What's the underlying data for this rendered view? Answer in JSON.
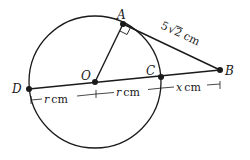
{
  "diagram": {
    "points": {
      "A": {
        "label": "A",
        "x": 123,
        "y": 24
      },
      "B": {
        "label": "B",
        "x": 220,
        "y": 70
      },
      "C": {
        "label": "C",
        "x": 161,
        "y": 77
      },
      "O": {
        "label": "O",
        "x": 95,
        "y": 82
      },
      "D": {
        "label": "D",
        "x": 29,
        "y": 89
      }
    },
    "circle": {
      "center": "O",
      "radius": 66
    },
    "segments": [
      "OA",
      "AB",
      "DB"
    ],
    "right_angle_at": "A",
    "labels": {
      "AB_length": "5√2 cm",
      "AB_coef": "5",
      "AB_root": "2",
      "AB_unit": "cm",
      "DO_var": "r",
      "DO_unit": "cm",
      "OC_var": "r",
      "OC_unit": "cm",
      "CB_var": "x",
      "CB_unit": "cm"
    },
    "stroke_color": "#1a1a1a"
  }
}
